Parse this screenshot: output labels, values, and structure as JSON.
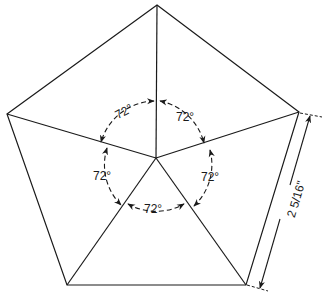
{
  "diagram": {
    "shape": "regular pentagon divided into 5 triangles from center",
    "angle_labels": [
      "72°",
      "72°",
      "72°",
      "72°",
      "72°"
    ],
    "dimension_label": "2 5/16\"",
    "colors": {
      "stroke": "#1a1a1a",
      "background": "#ffffff"
    }
  }
}
